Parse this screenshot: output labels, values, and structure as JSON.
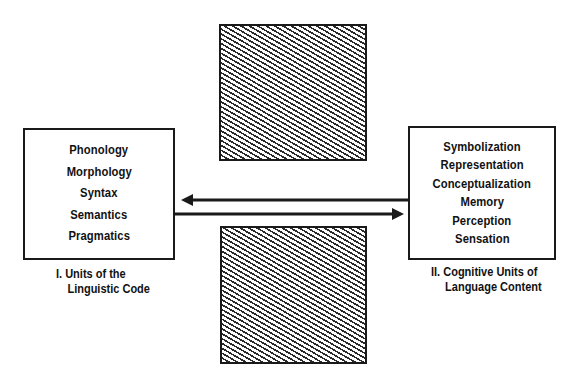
{
  "diagram": {
    "left_box": {
      "items": [
        "Phonology",
        "Morphology",
        "Syntax",
        "Semantics",
        "Pragmatics"
      ],
      "caption_line1": "I. Units of the",
      "caption_line2": "Linguistic Code"
    },
    "right_box": {
      "items": [
        "Symbolization",
        "Representation",
        "Conceptualization",
        "Memory",
        "Perception",
        "Sensation"
      ],
      "caption_line1": "II. Cognitive Units of",
      "caption_line2": "Language Content"
    },
    "arrows": [
      {
        "direction": "right-to-left",
        "from": "right_box",
        "to": "left_box"
      },
      {
        "direction": "left-to-right",
        "from": "left_box",
        "to": "right_box"
      }
    ],
    "hatched_blocks": [
      {
        "position": "top",
        "pattern": "diagonal-hatch"
      },
      {
        "position": "bottom",
        "pattern": "diagonal-hatch"
      }
    ],
    "colors": {
      "ink": "#1a1a1a",
      "background": "#ffffff"
    }
  }
}
